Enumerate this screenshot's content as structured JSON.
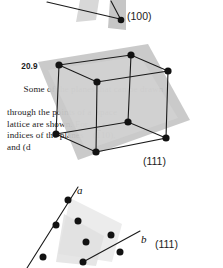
{
  "figure": {
    "kind": "crystallography-plane-diagram",
    "source_problem": "20.9",
    "background_text": {
      "problem_number": "20.9",
      "lines": [
        "20.9  Some of the planes that can be drawn",
        "through the points of a space",
        "lattice are shown. For",
        "indices of the planes (110),  (110),",
        "and (d"
      ],
      "visible_fragments_left": [
        "20.9  Some of th",
        "thro",
        "lattic",
        "indice",
        "and (d"
      ],
      "visible_fragments_right": [
        "t can be drawn",
        "space",
        "r",
        "(110),",
        ""
      ]
    },
    "panels": [
      {
        "id": "top-panel",
        "label": "(100)",
        "description": "partially cropped upper figure showing a (100) plane with a lattice point and leader line"
      },
      {
        "id": "middle-panel",
        "label": "(111)",
        "description": "cubic space lattice with corner lattice points, body point, and a shaded (111) plane cutting diagonally"
      },
      {
        "id": "bottom-panel",
        "label": "(111)",
        "description": "lattice plane viewed with axes a and b drawn through rows of lattice points",
        "axes": [
          {
            "name": "a"
          },
          {
            "name": "b"
          }
        ]
      }
    ],
    "colors": {
      "lattice_point": "#121212",
      "edge": "#1a1a1a",
      "plane_fill": "#c9c9c9",
      "plane_fill_light": "#e2e2e2",
      "page_background": "#ffffff",
      "text": "#1b1b1b"
    },
    "lattice_points_middle": [
      {
        "x": 59,
        "y": 65
      },
      {
        "x": 131,
        "y": 55
      },
      {
        "x": 168,
        "y": 71
      },
      {
        "x": 97,
        "y": 82
      },
      {
        "x": 56,
        "y": 134
      },
      {
        "x": 128,
        "y": 122
      },
      {
        "x": 166,
        "y": 138
      },
      {
        "x": 96,
        "y": 152
      }
    ],
    "lattice_points_bottom": [
      {
        "x": 58,
        "y": 196
      },
      {
        "x": 47,
        "y": 221
      },
      {
        "x": 36,
        "y": 252
      },
      {
        "x": 74,
        "y": 219
      },
      {
        "x": 70,
        "y": 244
      },
      {
        "x": 105,
        "y": 233
      },
      {
        "x": 93,
        "y": 264
      },
      {
        "x": 119,
        "y": 254
      },
      {
        "x": 83,
        "y": 262
      }
    ]
  }
}
